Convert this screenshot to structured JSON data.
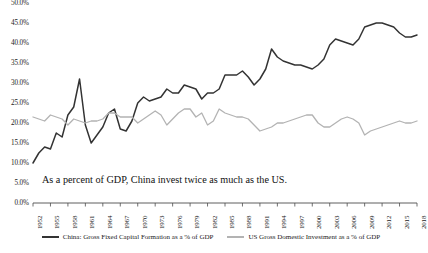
{
  "chart_data": {
    "type": "line",
    "title": "",
    "subtitle": "",
    "xlabel": "",
    "ylabel": "",
    "ylim": [
      0,
      50
    ],
    "ytick_labels": [
      "0.0%",
      "5.0%",
      "10.0%",
      "15.0%",
      "20.0%",
      "25.0%",
      "30.0%",
      "35.0%",
      "40.0%",
      "45.0%",
      "50.0%"
    ],
    "ytick_values": [
      0,
      5,
      10,
      15,
      20,
      25,
      30,
      35,
      40,
      45,
      50
    ],
    "grid": false,
    "legend_position": "bottom",
    "annotation": "As a percent of GDP, China invest twice as much as the US.",
    "x": [
      1952,
      1953,
      1954,
      1955,
      1956,
      1957,
      1958,
      1959,
      1960,
      1961,
      1962,
      1963,
      1964,
      1965,
      1966,
      1967,
      1968,
      1969,
      1970,
      1971,
      1972,
      1973,
      1974,
      1975,
      1976,
      1977,
      1978,
      1979,
      1980,
      1981,
      1982,
      1983,
      1984,
      1985,
      1986,
      1987,
      1988,
      1989,
      1990,
      1991,
      1992,
      1993,
      1994,
      1995,
      1996,
      1997,
      1998,
      1999,
      2000,
      2001,
      2002,
      2003,
      2004,
      2005,
      2006,
      2007,
      2008,
      2009,
      2010,
      2011,
      2012,
      2013,
      2014,
      2015,
      2016,
      2017,
      2018
    ],
    "xtick_labels": [
      "1952",
      "1955",
      "1958",
      "1961",
      "1964",
      "1967",
      "1970",
      "1973",
      "1976",
      "1979",
      "1982",
      "1985",
      "1988",
      "1991",
      "1994",
      "1997",
      "2000",
      "2003",
      "2006",
      "2009",
      "2012",
      "2015",
      "2018"
    ],
    "xtick_values": [
      1952,
      1955,
      1958,
      1961,
      1964,
      1967,
      1970,
      1973,
      1976,
      1979,
      1982,
      1985,
      1988,
      1991,
      1994,
      1997,
      2000,
      2003,
      2006,
      2009,
      2012,
      2015,
      2018
    ],
    "series": [
      {
        "name": "China: Gross Fixed Capital Formation as a % of GDP",
        "color": "#333333",
        "values": [
          10.0,
          12.5,
          14.0,
          13.5,
          17.5,
          16.5,
          22.0,
          24.0,
          31.0,
          19.5,
          15.0,
          17.0,
          19.0,
          22.5,
          23.5,
          18.5,
          18.0,
          20.5,
          25.0,
          26.5,
          25.5,
          26.0,
          26.5,
          28.5,
          27.5,
          27.5,
          29.5,
          29.0,
          28.5,
          26.0,
          27.5,
          27.5,
          28.5,
          32.0,
          32.0,
          32.0,
          33.0,
          31.5,
          29.5,
          31.0,
          33.5,
          38.5,
          36.5,
          35.5,
          35.0,
          34.5,
          34.5,
          34.0,
          33.5,
          34.5,
          36.0,
          39.5,
          41.0,
          40.5,
          40.0,
          39.5,
          41.0,
          44.0,
          44.5,
          45.0,
          45.0,
          44.5,
          44.0,
          42.5,
          41.5,
          41.5,
          42.0
        ]
      },
      {
        "name": "US Gross Domestic Investment as a % of GDP",
        "color": "#b3b3b3",
        "values": [
          21.5,
          21.0,
          20.5,
          22.0,
          21.5,
          21.0,
          19.5,
          21.0,
          20.5,
          20.0,
          20.5,
          20.5,
          21.0,
          22.5,
          22.5,
          21.5,
          21.5,
          21.5,
          20.0,
          21.0,
          22.0,
          23.0,
          22.0,
          19.5,
          21.0,
          22.5,
          23.5,
          23.5,
          21.5,
          22.5,
          19.5,
          20.5,
          23.5,
          22.5,
          22.0,
          21.5,
          21.5,
          21.0,
          19.5,
          18.0,
          18.5,
          19.0,
          20.0,
          20.0,
          20.5,
          21.0,
          21.5,
          22.0,
          22.0,
          20.0,
          19.0,
          19.0,
          20.0,
          21.0,
          21.5,
          21.0,
          20.0,
          17.0,
          18.0,
          18.5,
          19.0,
          19.5,
          20.0,
          20.5,
          20.0,
          20.0,
          20.5
        ]
      }
    ]
  },
  "legend": {
    "items": [
      {
        "label": "China: Gross Fixed Capital Formation as a % of GDP",
        "color": "#333333"
      },
      {
        "label": "US Gross Domestic Investment as a % of GDP",
        "color": "#b3b3b3"
      }
    ]
  }
}
